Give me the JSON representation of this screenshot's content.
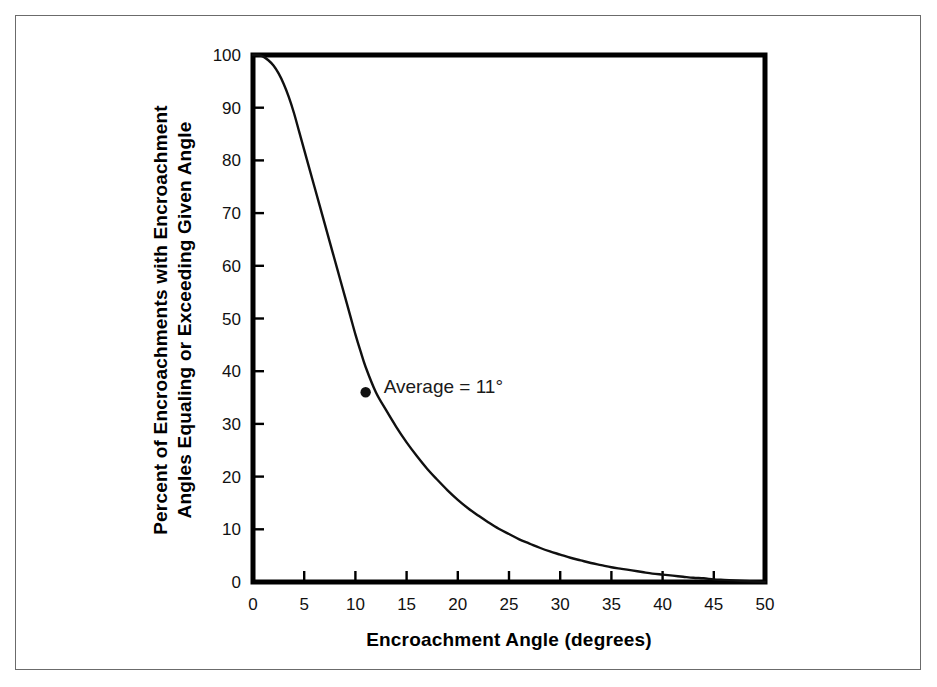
{
  "chart_data": {
    "type": "line",
    "title": "",
    "xlabel": "Encroachment Angle (degrees)",
    "ylabel_line1": "Percent of Encroachments with Encroachment",
    "ylabel_line2": "Angles Equaling or Exceeding Given Angle",
    "xlim": [
      0,
      50
    ],
    "ylim": [
      0,
      100
    ],
    "xticks": [
      0,
      5,
      10,
      15,
      20,
      25,
      30,
      35,
      40,
      45,
      50
    ],
    "yticks": [
      0,
      10,
      20,
      30,
      40,
      50,
      60,
      70,
      80,
      90,
      100
    ],
    "grid": false,
    "legend": "none",
    "line_color": "#101010",
    "series": [
      {
        "name": "Cumulative percent of encroachments",
        "x": [
          0,
          0.5,
          1,
          1.5,
          2,
          2.5,
          3,
          3.5,
          4,
          4.5,
          5,
          5.5,
          6,
          6.5,
          7,
          7.5,
          8,
          8.5,
          9,
          9.5,
          10,
          10.5,
          11,
          12,
          13,
          14,
          15,
          16,
          17,
          18,
          19,
          20,
          21,
          22,
          23,
          24,
          25,
          26,
          27,
          28,
          29,
          30,
          31,
          32,
          33,
          34,
          35,
          36,
          37,
          38,
          39,
          40,
          41,
          42,
          43,
          44,
          45,
          46,
          47,
          48,
          49,
          50
        ],
        "values": [
          100,
          100,
          99.7,
          99,
          98,
          96.5,
          94.5,
          92,
          89,
          85.5,
          82,
          78.5,
          75,
          71.5,
          68,
          64.5,
          61,
          57.5,
          54,
          50.5,
          47,
          43.8,
          40.8,
          36,
          32.6,
          29.4,
          26.5,
          23.9,
          21.5,
          19.4,
          17.4,
          15.6,
          14.0,
          12.6,
          11.3,
          10.1,
          9.1,
          8.1,
          7.3,
          6.5,
          5.8,
          5.2,
          4.6,
          4.1,
          3.6,
          3.2,
          2.8,
          2.5,
          2.2,
          1.9,
          1.6,
          1.4,
          1.2,
          1.0,
          0.8,
          0.7,
          0.5,
          0.4,
          0.3,
          0.2,
          0.1,
          0
        ]
      }
    ],
    "annotations": [
      {
        "name": "average-marker",
        "label": "Average = 11°",
        "x": 11,
        "y": 36,
        "marker": "dot"
      }
    ]
  }
}
